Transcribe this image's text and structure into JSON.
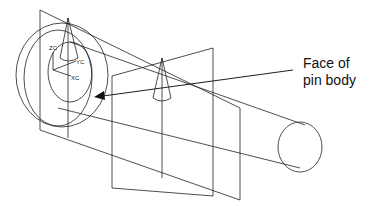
{
  "diagram": {
    "callout_line1": "Face of",
    "callout_line2": "pin body",
    "axis_labels": {
      "zc": "ZC",
      "yc": "YC",
      "xc": "XC"
    },
    "stroke_color": "#222222",
    "background": "#ffffff"
  }
}
